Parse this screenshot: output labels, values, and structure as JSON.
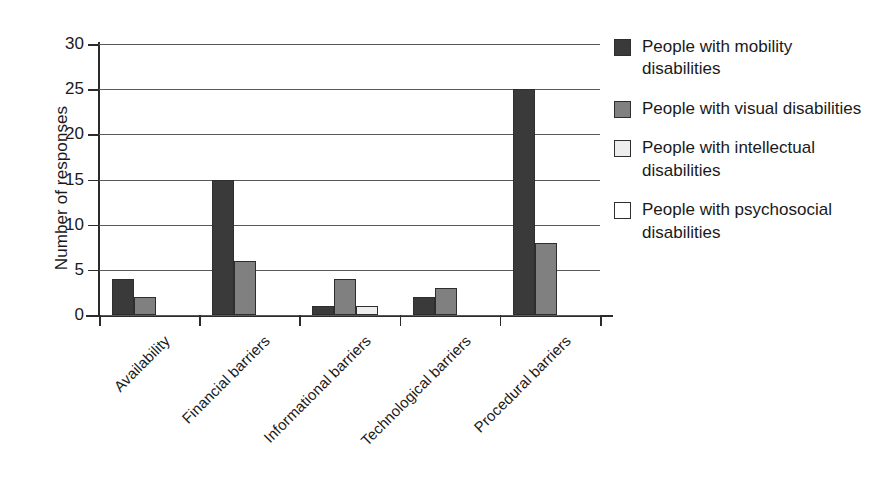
{
  "chart_data": {
    "type": "bar",
    "title": "",
    "xlabel": "",
    "ylabel": "Number of responses",
    "ylim": [
      0,
      30
    ],
    "yticks": [
      0,
      5,
      10,
      15,
      20,
      25,
      30
    ],
    "grid": true,
    "legend_position": "right",
    "categories": [
      "Availability",
      "Financial barriers",
      "Informational barriers",
      "Technological barriers",
      "Procedural barriers"
    ],
    "series": [
      {
        "name": "People with mobility disabilities",
        "color": "#3a3a3a",
        "values": [
          4,
          15,
          1,
          2,
          25
        ]
      },
      {
        "name": "People with visual disabilities",
        "color": "#808080",
        "values": [
          2,
          6,
          4,
          3,
          8
        ]
      },
      {
        "name": "People with intellectual disabilities",
        "color": "#ededed",
        "values": [
          0,
          0,
          1,
          0,
          0
        ]
      },
      {
        "name": "People with psychosocial disabilities",
        "color": "#ffffff",
        "values": [
          0,
          0,
          0,
          0,
          0
        ]
      }
    ]
  },
  "axis": {
    "y_title": "Number of responses",
    "tick_labels": [
      "0",
      "5",
      "10",
      "15",
      "20",
      "25",
      "30"
    ]
  },
  "legend": {
    "entries": [
      {
        "label": "People with mobility disabilities",
        "color": "#3a3a3a"
      },
      {
        "label": "People with visual disabilities",
        "color": "#808080"
      },
      {
        "label": "People with intellectual disabilities",
        "color": "#ededed"
      },
      {
        "label": "People with psychosocial disabilities",
        "color": "#ffffff"
      }
    ]
  }
}
